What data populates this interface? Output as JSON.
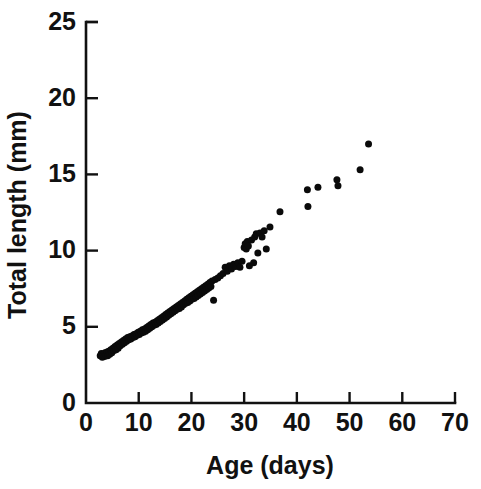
{
  "chart_data": {
    "type": "scatter",
    "title": "",
    "xlabel": "Age (days)",
    "ylabel": "Total length (mm)",
    "xlim": [
      0,
      70
    ],
    "ylim": [
      0,
      25
    ],
    "xticks": [
      0,
      10,
      20,
      30,
      40,
      50,
      60,
      70
    ],
    "yticks": [
      0,
      5,
      10,
      15,
      20,
      25
    ],
    "xtick_labels": [
      "0",
      "10",
      "20",
      "30",
      "40",
      "50",
      "60",
      "70"
    ],
    "ytick_labels": [
      "0",
      "5",
      "10",
      "15",
      "20",
      "25"
    ],
    "grid": false,
    "legend": null,
    "marker": "filled-circle",
    "marker_color": "#0a0a0a",
    "marker_size_px": 7,
    "n_points": 155,
    "series": [
      {
        "name": "Total length vs age",
        "points": [
          [
            2.7,
            3.1
          ],
          [
            2.9,
            3.25
          ],
          [
            3.1,
            3.0
          ],
          [
            3.3,
            3.2
          ],
          [
            3.5,
            3.05
          ],
          [
            3.6,
            3.3
          ],
          [
            3.8,
            3.15
          ],
          [
            4.0,
            3.35
          ],
          [
            4.1,
            3.1
          ],
          [
            4.3,
            3.4
          ],
          [
            4.5,
            3.2
          ],
          [
            4.7,
            3.5
          ],
          [
            4.9,
            3.3
          ],
          [
            5.1,
            3.6
          ],
          [
            5.3,
            3.45
          ],
          [
            5.5,
            3.7
          ],
          [
            5.7,
            3.5
          ],
          [
            5.9,
            3.8
          ],
          [
            6.1,
            3.6
          ],
          [
            6.3,
            3.9
          ],
          [
            6.5,
            3.75
          ],
          [
            6.7,
            4.0
          ],
          [
            6.9,
            3.85
          ],
          [
            7.1,
            4.1
          ],
          [
            7.3,
            3.95
          ],
          [
            7.5,
            4.2
          ],
          [
            7.7,
            4.05
          ],
          [
            7.9,
            4.3
          ],
          [
            8.1,
            4.15
          ],
          [
            8.3,
            4.35
          ],
          [
            8.5,
            4.2
          ],
          [
            8.7,
            4.4
          ],
          [
            8.9,
            4.3
          ],
          [
            9.1,
            4.5
          ],
          [
            9.3,
            4.35
          ],
          [
            9.5,
            4.55
          ],
          [
            9.7,
            4.45
          ],
          [
            9.9,
            4.65
          ],
          [
            10.1,
            4.5
          ],
          [
            10.3,
            4.7
          ],
          [
            10.5,
            4.6
          ],
          [
            10.7,
            4.8
          ],
          [
            10.9,
            4.65
          ],
          [
            11.1,
            4.85
          ],
          [
            11.3,
            4.7
          ],
          [
            11.5,
            4.95
          ],
          [
            11.7,
            4.8
          ],
          [
            11.9,
            5.05
          ],
          [
            12.1,
            4.9
          ],
          [
            12.3,
            5.15
          ],
          [
            12.5,
            5.0
          ],
          [
            12.7,
            5.25
          ],
          [
            12.9,
            5.1
          ],
          [
            13.1,
            5.3
          ],
          [
            13.3,
            5.15
          ],
          [
            13.5,
            5.4
          ],
          [
            13.7,
            5.25
          ],
          [
            13.9,
            5.5
          ],
          [
            14.1,
            5.35
          ],
          [
            14.3,
            5.6
          ],
          [
            14.5,
            5.45
          ],
          [
            14.7,
            5.7
          ],
          [
            14.9,
            5.55
          ],
          [
            15.1,
            5.8
          ],
          [
            15.3,
            5.65
          ],
          [
            15.5,
            5.9
          ],
          [
            15.7,
            5.75
          ],
          [
            15.9,
            6.0
          ],
          [
            16.1,
            5.85
          ],
          [
            16.3,
            6.1
          ],
          [
            16.5,
            5.95
          ],
          [
            16.7,
            6.2
          ],
          [
            16.9,
            6.05
          ],
          [
            17.1,
            6.3
          ],
          [
            17.3,
            6.15
          ],
          [
            17.5,
            6.4
          ],
          [
            17.7,
            6.2
          ],
          [
            17.9,
            6.5
          ],
          [
            18.1,
            6.3
          ],
          [
            18.3,
            6.6
          ],
          [
            18.5,
            6.45
          ],
          [
            18.7,
            6.7
          ],
          [
            18.9,
            6.55
          ],
          [
            19.1,
            6.8
          ],
          [
            19.3,
            6.6
          ],
          [
            19.5,
            6.9
          ],
          [
            19.7,
            6.7
          ],
          [
            19.9,
            7.0
          ],
          [
            20.1,
            6.8
          ],
          [
            20.3,
            7.1
          ],
          [
            20.5,
            6.85
          ],
          [
            20.7,
            7.2
          ],
          [
            20.9,
            6.95
          ],
          [
            21.1,
            7.3
          ],
          [
            21.3,
            7.05
          ],
          [
            21.5,
            7.4
          ],
          [
            21.7,
            7.15
          ],
          [
            21.9,
            7.5
          ],
          [
            22.1,
            7.25
          ],
          [
            22.3,
            7.6
          ],
          [
            22.5,
            7.35
          ],
          [
            22.7,
            7.7
          ],
          [
            22.9,
            7.45
          ],
          [
            23.1,
            7.8
          ],
          [
            23.3,
            7.55
          ],
          [
            23.5,
            7.9
          ],
          [
            23.7,
            7.65
          ],
          [
            23.9,
            8.0
          ],
          [
            24.2,
            6.75
          ],
          [
            24.5,
            8.1
          ],
          [
            25.0,
            8.2
          ],
          [
            25.5,
            8.35
          ],
          [
            26.0,
            8.5
          ],
          [
            26.4,
            8.9
          ],
          [
            26.8,
            8.65
          ],
          [
            27.2,
            9.0
          ],
          [
            27.6,
            8.8
          ],
          [
            28.0,
            9.1
          ],
          [
            28.4,
            8.95
          ],
          [
            28.8,
            9.2
          ],
          [
            29.2,
            8.9
          ],
          [
            29.6,
            9.3
          ],
          [
            30.0,
            10.2
          ],
          [
            30.2,
            10.45
          ],
          [
            30.4,
            10.1
          ],
          [
            30.6,
            10.6
          ],
          [
            30.8,
            10.3
          ],
          [
            31.0,
            9.0
          ],
          [
            31.4,
            10.7
          ],
          [
            31.8,
            9.2
          ],
          [
            32.0,
            10.9
          ],
          [
            32.3,
            11.1
          ],
          [
            32.6,
            9.85
          ],
          [
            33.0,
            11.15
          ],
          [
            33.4,
            10.9
          ],
          [
            33.8,
            11.3
          ],
          [
            34.2,
            10.1
          ],
          [
            34.9,
            11.55
          ],
          [
            36.8,
            12.55
          ],
          [
            42.0,
            14.0
          ],
          [
            42.1,
            12.9
          ],
          [
            44.0,
            14.15
          ],
          [
            47.6,
            14.65
          ],
          [
            47.8,
            14.25
          ],
          [
            52.0,
            15.3
          ],
          [
            53.6,
            17.0
          ]
        ]
      }
    ]
  },
  "axes": {
    "x_axis_name": "x-axis",
    "y_axis_name": "y-axis"
  }
}
